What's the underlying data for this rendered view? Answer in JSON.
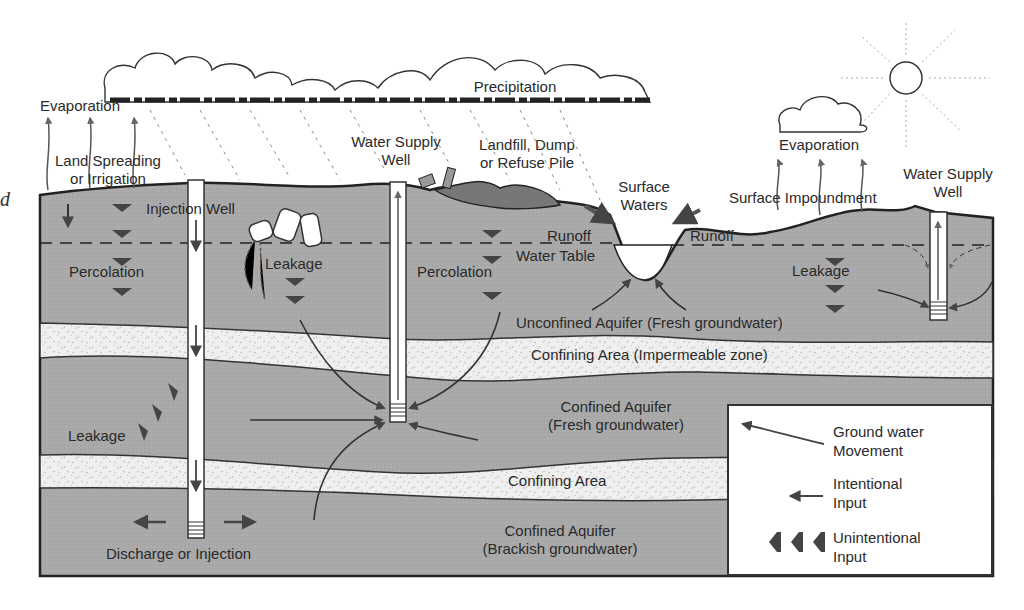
{
  "diagram": {
    "colors": {
      "aquifer": "#a8a8a8",
      "confining": "#ececec",
      "outline": "#2a2a2a",
      "arrow": "#4a4a4a",
      "background": "#ffffff"
    },
    "atmosphere": {
      "precipitation": "Precipitation",
      "evaporation_left": "Evaporation",
      "evaporation_right": "Evaporation"
    },
    "surface_labels": {
      "land_spreading": [
        "Land Spreading",
        "or Irrigation"
      ],
      "injection_well": "Injection Well",
      "water_supply_well_center": [
        "Water Supply",
        "Well"
      ],
      "landfill": [
        "Landfill, Dump",
        "or Refuse Pile"
      ],
      "surface_waters": [
        "Surface",
        "Waters"
      ],
      "surface_impoundment": "Surface Impoundment",
      "water_supply_well_right": [
        "Water Supply",
        "Well"
      ],
      "runoff_left": "Runoff",
      "runoff_right": "Runoff",
      "water_table": "Water Table"
    },
    "subsurface_labels": {
      "percolation_left": "Percolation",
      "leakage_barrels": "Leakage",
      "percolation_center": "Percolation",
      "leakage_right": "Leakage",
      "unconfined_aquifer": "Unconfined Aquifer (Fresh groundwater)",
      "confining_area_1": "Confining Area (Impermeable zone)",
      "confined_aquifer_fresh": [
        "Confined Aquifer",
        "(Fresh groundwater)"
      ],
      "leakage_deep": "Leakage",
      "confining_area_2": "Confining Area",
      "confined_aquifer_brackish": [
        "Confined Aquifer",
        "(Brackish groundwater)"
      ],
      "discharge_injection": "Discharge or Injection"
    },
    "margin_glyph": "d",
    "legend": {
      "items": [
        {
          "symbol": "curved-arrow-icon",
          "label": [
            "Ground water",
            "Movement"
          ]
        },
        {
          "symbol": "straight-arrow-icon",
          "label": [
            "Intentional",
            "Input"
          ]
        },
        {
          "symbol": "chevron-arrows-icon",
          "label": [
            "Unintentional",
            "Input"
          ]
        }
      ]
    }
  }
}
